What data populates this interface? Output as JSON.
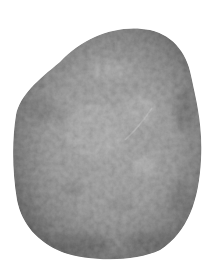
{
  "image": {
    "subject": "stone",
    "description": "Grayscale photograph of a rounded speckled stone on a white background",
    "colors": {
      "background": "#ffffff",
      "stone_light": "#b4b4b4",
      "stone_mid": "#8e8e8e",
      "stone_dark": "#3a3a3a"
    }
  }
}
